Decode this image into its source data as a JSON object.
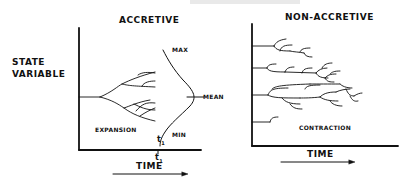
{
  "figure": {
    "cropped_header_text": "",
    "left_panel": {
      "title": "ACCRETIVE",
      "y_axis_label_line1": "STATE",
      "y_axis_label_line2": "VARIABLE",
      "x_axis_label": "TIME",
      "region_label": "EXPANSION",
      "distribution_labels": {
        "max": "MAX",
        "mean": "MEAN",
        "min": "MIN"
      },
      "time_marker_inside": "t",
      "time_marker_inside_sub": "1",
      "time_marker_axis": "t",
      "time_marker_axis_sub": "1"
    },
    "right_panel": {
      "title": "NON-ACCRETIVE",
      "x_axis_label": "TIME",
      "region_label": "CONTRACTION"
    },
    "colors": {
      "ink": "#111111",
      "background": "#ffffff"
    }
  }
}
